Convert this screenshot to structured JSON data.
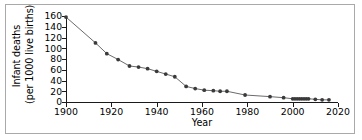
{
  "chart_data": {
    "type": "line",
    "title": "",
    "subtitle": "",
    "xlabel": "Year",
    "ylabel": "Infant deaths (per 1000 live births)",
    "ylabel_lines": [
      "Infant deaths",
      "(per 1000 live births)"
    ],
    "xlim": [
      1900,
      2020
    ],
    "ylim": [
      0,
      160
    ],
    "xticks": [
      1900,
      1920,
      1940,
      1960,
      1980,
      2000,
      2020
    ],
    "yticks": [
      0,
      20,
      40,
      60,
      80,
      100,
      120,
      140,
      160
    ],
    "grid": false,
    "legend": null,
    "marker": "filled-circle",
    "marker_color": "#3a3a3a",
    "line_color": "#6b6b6b",
    "x": [
      1900,
      1913,
      1918,
      1923,
      1928,
      1932,
      1936,
      1940,
      1944,
      1948,
      1953,
      1957,
      1961,
      1965,
      1968,
      1971,
      1979,
      1990,
      1996,
      2000,
      2001,
      2002,
      2003,
      2004,
      2005,
      2006,
      2007,
      2010,
      2013,
      2016
    ],
    "y": [
      158,
      110,
      90,
      79,
      67,
      65,
      62,
      57,
      52,
      47,
      29,
      25,
      22,
      21,
      20,
      20,
      13,
      10,
      8,
      6,
      6,
      6,
      6,
      6,
      6,
      6,
      6,
      5,
      4,
      4
    ],
    "series": [
      {
        "name": "Infant mortality rate",
        "points": [
          {
            "x": 1900,
            "y": 158
          },
          {
            "x": 1913,
            "y": 110
          },
          {
            "x": 1918,
            "y": 90
          },
          {
            "x": 1923,
            "y": 79
          },
          {
            "x": 1928,
            "y": 67
          },
          {
            "x": 1932,
            "y": 65
          },
          {
            "x": 1936,
            "y": 62
          },
          {
            "x": 1940,
            "y": 57
          },
          {
            "x": 1944,
            "y": 52
          },
          {
            "x": 1948,
            "y": 47
          },
          {
            "x": 1953,
            "y": 29
          },
          {
            "x": 1957,
            "y": 25
          },
          {
            "x": 1961,
            "y": 22
          },
          {
            "x": 1965,
            "y": 21
          },
          {
            "x": 1968,
            "y": 20
          },
          {
            "x": 1971,
            "y": 20
          },
          {
            "x": 1979,
            "y": 13
          },
          {
            "x": 1990,
            "y": 10
          },
          {
            "x": 1996,
            "y": 8
          },
          {
            "x": 2000,
            "y": 6
          },
          {
            "x": 2001,
            "y": 6
          },
          {
            "x": 2002,
            "y": 6
          },
          {
            "x": 2003,
            "y": 6
          },
          {
            "x": 2004,
            "y": 6
          },
          {
            "x": 2005,
            "y": 6
          },
          {
            "x": 2006,
            "y": 6
          },
          {
            "x": 2007,
            "y": 6
          },
          {
            "x": 2010,
            "y": 5
          },
          {
            "x": 2013,
            "y": 4
          },
          {
            "x": 2016,
            "y": 4
          }
        ]
      }
    ]
  },
  "frame": {
    "border_color": "#a9a9a9",
    "background": "#ffffff"
  }
}
